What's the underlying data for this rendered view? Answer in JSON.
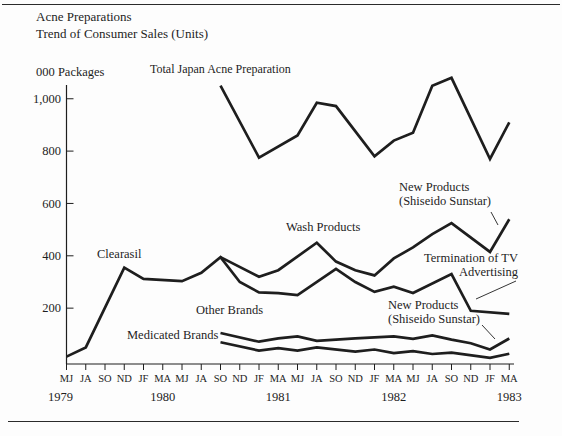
{
  "title": {
    "line1": "Acne Preparations",
    "line2": "Trend of Consumer Sales (Units)"
  },
  "y_axis_unit": "000 Packages",
  "annotations": {
    "total": "Total Japan Acne Preparation",
    "clearasil": "Clearasil",
    "wash": "Wash Products",
    "new_products_top": "New Products\n(Shiseido Sunstar)",
    "termination": "Termination of TV\nAdvertising",
    "new_products_bottom": "New Products\n(Shiseido Sunstar)",
    "other_brands": "Other Brands",
    "medicated_brands": "Medicated Brands"
  },
  "chart_data": {
    "type": "line",
    "ylabel": "000 Packages",
    "ylim": [
      0,
      1150
    ],
    "grid": false,
    "legend": "inline-annotations",
    "line_color": "#1e1e1e",
    "y_ticks": [
      {
        "label": "1,000",
        "value": 1000
      },
      {
        "label": "800",
        "value": 800
      },
      {
        "label": "600",
        "value": 600
      },
      {
        "label": "400",
        "value": 400
      },
      {
        "label": "200",
        "value": 200
      }
    ],
    "x_tick_labels": [
      "MJ",
      "JA",
      "SO",
      "ND",
      "JF",
      "MA",
      "MJ",
      "JA",
      "SO",
      "ND",
      "JF",
      "MA",
      "MJ",
      "JA",
      "SO",
      "ND",
      "JF",
      "MA",
      "MJ",
      "JA",
      "SO",
      "ND",
      "JF",
      "MA"
    ],
    "year_labels": [
      {
        "label": "1979",
        "tick_index": 0
      },
      {
        "label": "1980",
        "tick_index": 5
      },
      {
        "label": "1981",
        "tick_index": 11
      },
      {
        "label": "1982",
        "tick_index": 17
      },
      {
        "label": "1983",
        "tick_index": 23
      }
    ],
    "series": [
      {
        "name": "Total Japan Acne Preparation",
        "points": [
          [
            8,
            1050
          ],
          [
            10,
            775
          ],
          [
            12,
            860
          ],
          [
            13,
            985
          ],
          [
            14,
            972
          ],
          [
            16,
            780
          ],
          [
            17,
            840
          ],
          [
            18,
            870
          ],
          [
            19,
            1050
          ],
          [
            20,
            1080
          ],
          [
            22,
            770
          ],
          [
            23,
            910
          ]
        ]
      },
      {
        "name": "Wash Products",
        "points": [
          [
            8,
            395
          ],
          [
            10,
            320
          ],
          [
            11,
            345
          ],
          [
            13,
            450
          ],
          [
            14,
            378
          ],
          [
            15,
            345
          ],
          [
            16,
            325
          ],
          [
            17,
            390
          ],
          [
            18,
            432
          ],
          [
            19,
            483
          ],
          [
            20,
            525
          ],
          [
            22,
            415
          ],
          [
            23,
            540
          ]
        ]
      },
      {
        "name": "Clearasil",
        "points": [
          [
            0,
            15
          ],
          [
            1,
            50
          ],
          [
            3,
            355
          ],
          [
            4,
            312
          ],
          [
            6,
            303
          ],
          [
            7,
            335
          ],
          [
            8,
            395
          ],
          [
            9,
            300
          ],
          [
            10,
            260
          ],
          [
            11,
            257
          ],
          [
            12,
            250
          ],
          [
            14,
            350
          ],
          [
            15,
            300
          ],
          [
            16,
            262
          ],
          [
            17,
            282
          ],
          [
            18,
            258
          ],
          [
            20,
            330
          ],
          [
            21,
            190
          ],
          [
            23,
            178
          ]
        ]
      },
      {
        "name": "Other Brands",
        "points": [
          [
            8,
            105
          ],
          [
            10,
            72
          ],
          [
            11,
            85
          ],
          [
            12,
            92
          ],
          [
            13,
            75
          ],
          [
            15,
            85
          ],
          [
            17,
            92
          ],
          [
            18,
            83
          ],
          [
            19,
            96
          ],
          [
            20,
            80
          ],
          [
            21,
            66
          ],
          [
            22,
            42
          ],
          [
            23,
            84
          ]
        ]
      },
      {
        "name": "Medicated Brands",
        "points": [
          [
            8,
            70
          ],
          [
            10,
            38
          ],
          [
            11,
            47
          ],
          [
            12,
            38
          ],
          [
            13,
            50
          ],
          [
            15,
            34
          ],
          [
            16,
            42
          ],
          [
            17,
            28
          ],
          [
            18,
            36
          ],
          [
            19,
            25
          ],
          [
            20,
            30
          ],
          [
            22,
            10
          ],
          [
            23,
            26
          ]
        ]
      }
    ]
  }
}
